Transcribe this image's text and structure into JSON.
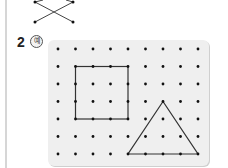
{
  "question": {
    "number": "2",
    "example_label": "예"
  },
  "top_figure": {
    "description": "crossing lines connecting dots",
    "dots": [
      [
        35,
        2
      ],
      [
        73,
        2
      ],
      [
        35,
        22
      ],
      [
        73,
        22
      ]
    ],
    "lines": [
      [
        [
          35,
          22
        ],
        [
          73,
          2
        ]
      ],
      [
        [
          35,
          2
        ],
        [
          73,
          22
        ]
      ],
      [
        [
          43,
          0
        ],
        [
          35,
          2
        ]
      ],
      [
        [
          73,
          2
        ],
        [
          66,
          0
        ]
      ]
    ]
  },
  "geoboard": {
    "columns": 9,
    "rows": 7,
    "origin": [
      58,
      49
    ],
    "spacing": [
      17.5,
      17.5
    ],
    "square": {
      "col0": 1,
      "row0": 1,
      "col1": 4,
      "row1": 4
    },
    "triangle": {
      "apex": [
        6,
        3
      ],
      "base_left": [
        4,
        6
      ],
      "base_right": [
        8,
        6
      ]
    },
    "colors": {
      "panel": "#efefef",
      "dot": "#111111",
      "line": "#333333"
    }
  }
}
